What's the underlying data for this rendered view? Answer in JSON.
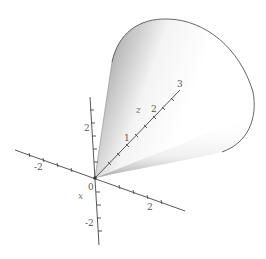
{
  "figure": {
    "type": "3d-surface-plot",
    "colors": {
      "axis": "#444444",
      "outline": "#555555",
      "surface_dark": "#8a8a8a",
      "surface_light": "#ffffff",
      "background": "#ffffff"
    }
  },
  "axes": {
    "vertical": {
      "ticks": [
        "2",
        "-2"
      ]
    },
    "horizontal": {
      "ticks": [
        "-2",
        "2"
      ]
    },
    "z": {
      "label": "z",
      "ticks": [
        "1",
        "2",
        "3"
      ]
    },
    "x_label": "x",
    "origin_label": "0"
  }
}
